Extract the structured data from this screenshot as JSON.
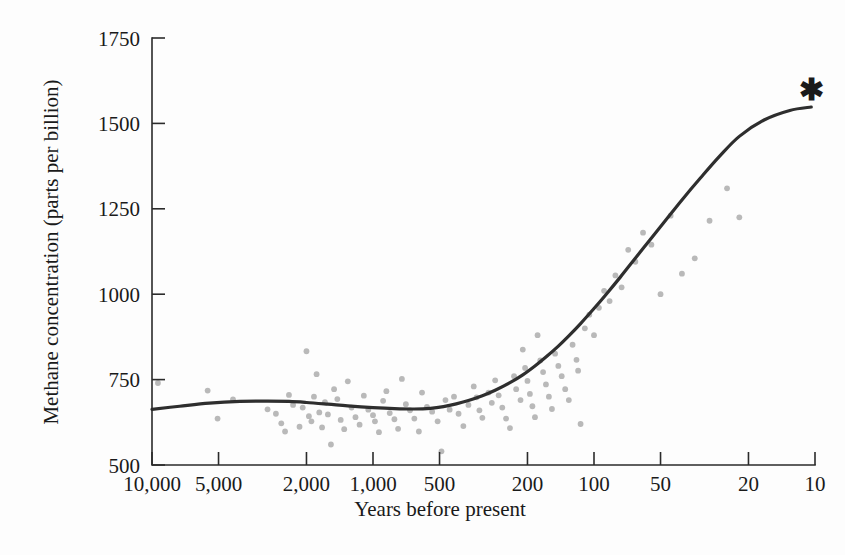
{
  "figure": {
    "background_color": "#fdfdfd",
    "curve_color": "#2e2e2e",
    "point_color": "#b9b9b9",
    "axis_color": "#2b2b2b",
    "star_symbol": "✱"
  },
  "chart_data": {
    "type": "scatter",
    "title": "",
    "xlabel": "Years before present",
    "ylabel": "Methane concentration (parts per billion)",
    "x_scale": "log-reversed",
    "xlim": [
      10000,
      10
    ],
    "ylim": [
      500,
      1750
    ],
    "grid": false,
    "legend": null,
    "xticks": [
      10000,
      5000,
      2000,
      1000,
      500,
      200,
      100,
      50,
      20,
      10
    ],
    "xtick_labels": [
      "10,000",
      "5,000",
      "2,000",
      "1,000",
      "500",
      "200",
      "100",
      "50",
      "20",
      "10"
    ],
    "yticks": [
      500,
      750,
      1000,
      1250,
      1500,
      1750
    ],
    "ytick_labels": [
      "500",
      "750",
      "1000",
      "1250",
      "1500",
      "1750"
    ],
    "annotations": [
      {
        "symbol": "*",
        "x": 10,
        "y": 1545,
        "note": "present-day value marker"
      }
    ],
    "series": [
      {
        "name": "Ice-core methane measurements",
        "type": "scatter",
        "marker": "circle",
        "color": "#b9b9b9",
        "points": [
          [
            9400,
            740
          ],
          [
            5600,
            718
          ],
          [
            5050,
            636
          ],
          [
            4300,
            692
          ],
          [
            3000,
            663
          ],
          [
            2750,
            650
          ],
          [
            2600,
            622
          ],
          [
            2500,
            598
          ],
          [
            2400,
            705
          ],
          [
            2300,
            676
          ],
          [
            2150,
            612
          ],
          [
            2080,
            668
          ],
          [
            2000,
            833
          ],
          [
            1950,
            643
          ],
          [
            1900,
            628
          ],
          [
            1850,
            700
          ],
          [
            1800,
            766
          ],
          [
            1750,
            654
          ],
          [
            1700,
            610
          ],
          [
            1650,
            684
          ],
          [
            1600,
            648
          ],
          [
            1550,
            560
          ],
          [
            1500,
            722
          ],
          [
            1450,
            693
          ],
          [
            1400,
            632
          ],
          [
            1350,
            605
          ],
          [
            1300,
            745
          ],
          [
            1250,
            668
          ],
          [
            1200,
            640
          ],
          [
            1150,
            618
          ],
          [
            1100,
            703
          ],
          [
            1050,
            662
          ],
          [
            1000,
            646
          ],
          [
            980,
            628
          ],
          [
            940,
            596
          ],
          [
            900,
            688
          ],
          [
            870,
            716
          ],
          [
            840,
            652
          ],
          [
            800,
            634
          ],
          [
            770,
            606
          ],
          [
            740,
            752
          ],
          [
            710,
            678
          ],
          [
            680,
            660
          ],
          [
            650,
            636
          ],
          [
            620,
            598
          ],
          [
            600,
            712
          ],
          [
            570,
            670
          ],
          [
            540,
            656
          ],
          [
            510,
            628
          ],
          [
            490,
            540
          ],
          [
            470,
            690
          ],
          [
            450,
            662
          ],
          [
            430,
            700
          ],
          [
            410,
            650
          ],
          [
            390,
            614
          ],
          [
            370,
            676
          ],
          [
            350,
            730
          ],
          [
            340,
            698
          ],
          [
            330,
            660
          ],
          [
            320,
            638
          ],
          [
            300,
            712
          ],
          [
            290,
            682
          ],
          [
            280,
            748
          ],
          [
            270,
            704
          ],
          [
            260,
            668
          ],
          [
            250,
            636
          ],
          [
            240,
            608
          ],
          [
            230,
            760
          ],
          [
            225,
            722
          ],
          [
            215,
            690
          ],
          [
            210,
            838
          ],
          [
            205,
            784
          ],
          [
            200,
            746
          ],
          [
            195,
            708
          ],
          [
            190,
            672
          ],
          [
            185,
            640
          ],
          [
            180,
            880
          ],
          [
            175,
            806
          ],
          [
            170,
            772
          ],
          [
            165,
            736
          ],
          [
            160,
            700
          ],
          [
            155,
            664
          ],
          [
            150,
            826
          ],
          [
            145,
            790
          ],
          [
            140,
            760
          ],
          [
            135,
            722
          ],
          [
            130,
            690
          ],
          [
            125,
            852
          ],
          [
            120,
            808
          ],
          [
            118,
            776
          ],
          [
            115,
            620
          ],
          [
            110,
            900
          ],
          [
            105,
            940
          ],
          [
            100,
            880
          ],
          [
            95,
            960
          ],
          [
            90,
            1010
          ],
          [
            85,
            980
          ],
          [
            80,
            1055
          ],
          [
            75,
            1020
          ],
          [
            70,
            1130
          ],
          [
            65,
            1095
          ],
          [
            60,
            1180
          ],
          [
            55,
            1145
          ],
          [
            50,
            1000
          ],
          [
            45,
            1230
          ],
          [
            40,
            1060
          ],
          [
            35,
            1105
          ],
          [
            30,
            1215
          ],
          [
            25,
            1310
          ],
          [
            22,
            1225
          ]
        ]
      },
      {
        "name": "Smoothed trend",
        "type": "line",
        "color": "#2e2e2e",
        "points": [
          [
            10000,
            663
          ],
          [
            7500,
            672
          ],
          [
            5500,
            681
          ],
          [
            4000,
            686
          ],
          [
            3000,
            687
          ],
          [
            2400,
            686
          ],
          [
            2000,
            683
          ],
          [
            1600,
            678
          ],
          [
            1300,
            673
          ],
          [
            1000,
            668
          ],
          [
            800,
            665
          ],
          [
            650,
            664
          ],
          [
            550,
            666
          ],
          [
            480,
            671
          ],
          [
            420,
            679
          ],
          [
            370,
            689
          ],
          [
            320,
            703
          ],
          [
            280,
            719
          ],
          [
            240,
            741
          ],
          [
            210,
            764
          ],
          [
            185,
            790
          ],
          [
            165,
            816
          ],
          [
            145,
            848
          ],
          [
            130,
            878
          ],
          [
            115,
            914
          ],
          [
            100,
            958
          ],
          [
            88,
            1000
          ],
          [
            76,
            1050
          ],
          [
            66,
            1100
          ],
          [
            56,
            1158
          ],
          [
            48,
            1212
          ],
          [
            40,
            1276
          ],
          [
            33,
            1340
          ],
          [
            27,
            1404
          ],
          [
            22,
            1462
          ],
          [
            17,
            1510
          ],
          [
            13,
            1538
          ],
          [
            10.4,
            1548
          ]
        ]
      }
    ]
  },
  "axes": {
    "x_label": "Years before present",
    "y_label": "Methane concentration (parts per billion)"
  }
}
